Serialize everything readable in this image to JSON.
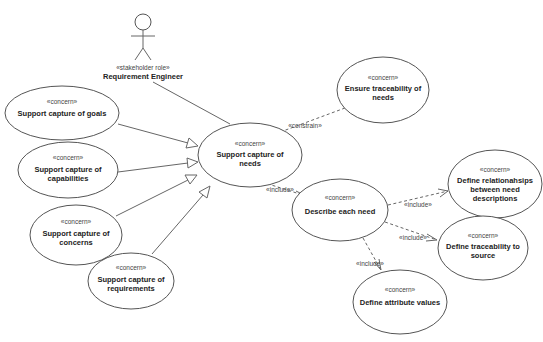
{
  "diagram": {
    "type": "UML use case diagram",
    "actor": {
      "stereotype": "«stakeholder role»",
      "name": "Requirement Engineer"
    },
    "nodes": [
      {
        "id": "goals",
        "stereotype": "«concern»",
        "lines": [
          "Support capture of goals"
        ]
      },
      {
        "id": "capabilities",
        "stereotype": "«concern»",
        "lines": [
          "Support capture of",
          "capabilities"
        ]
      },
      {
        "id": "concerns",
        "stereotype": "«concern»",
        "lines": [
          "Support capture of",
          "concerns"
        ]
      },
      {
        "id": "requirements",
        "stereotype": "«concern»",
        "lines": [
          "Support capture of",
          "requirements"
        ]
      },
      {
        "id": "needs",
        "stereotype": "«concern»",
        "lines": [
          "Support capture of",
          "needs"
        ]
      },
      {
        "id": "traceability_needs",
        "stereotype": "«concern»",
        "lines": [
          "Ensure traceability of",
          "needs"
        ]
      },
      {
        "id": "describe",
        "stereotype": "«concern»",
        "lines": [
          "Describe each need"
        ]
      },
      {
        "id": "relationships",
        "stereotype": "«concern»",
        "lines": [
          "Define relationahsips",
          "between need",
          "descriptions"
        ]
      },
      {
        "id": "traceability_source",
        "stereotype": "«concern»",
        "lines": [
          "Define traceability to",
          "source"
        ]
      },
      {
        "id": "attributes",
        "stereotype": "«concern»",
        "lines": [
          "Define attribute values"
        ]
      }
    ],
    "edges": [
      {
        "from": "actor",
        "to": "needs",
        "type": "association"
      },
      {
        "from": "goals",
        "to": "needs",
        "type": "generalization"
      },
      {
        "from": "capabilities",
        "to": "needs",
        "type": "generalization"
      },
      {
        "from": "concerns",
        "to": "needs",
        "type": "generalization"
      },
      {
        "from": "requirements",
        "to": "needs",
        "type": "generalization"
      },
      {
        "from": "traceability_needs",
        "to": "needs",
        "type": "dependency",
        "label": "«constrain»"
      },
      {
        "from": "needs",
        "to": "describe",
        "type": "dependency",
        "label": "«include»"
      },
      {
        "from": "describe",
        "to": "relationships",
        "type": "dependency",
        "label": "«include»"
      },
      {
        "from": "describe",
        "to": "traceability_source",
        "type": "dependency",
        "label": "«include»"
      },
      {
        "from": "describe",
        "to": "attributes",
        "type": "dependency",
        "label": "«include»"
      }
    ]
  }
}
